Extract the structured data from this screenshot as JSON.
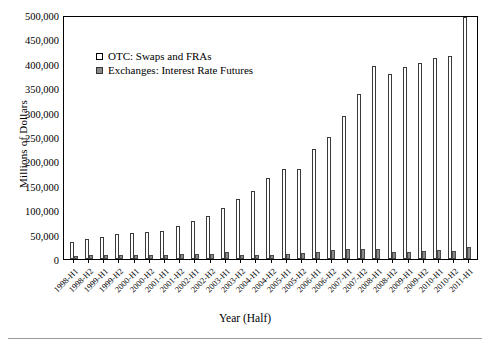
{
  "chart_data": {
    "type": "bar",
    "title": "",
    "xlabel": "Year (Half)",
    "ylabel": "Millions of Dollars",
    "ylim": [
      0,
      500000
    ],
    "yticks": [
      0,
      50000,
      100000,
      150000,
      200000,
      250000,
      300000,
      350000,
      400000,
      450000,
      500000
    ],
    "ytick_labels": [
      "0",
      "50,000",
      "100,000",
      "150,000",
      "200,000",
      "250,000",
      "300,000",
      "350,000",
      "400,000",
      "450,000",
      "500,000"
    ],
    "grid": false,
    "legend_position": "upper-left-inside",
    "categories": [
      "1998-H1",
      "1998-H2",
      "1999-H1",
      "1999-H2",
      "2000-H1",
      "2000-H2",
      "2001-H1",
      "2001-H2",
      "2002-H1",
      "2002-H2",
      "2003-H1",
      "2003-H2",
      "2004-H1",
      "2004-H2",
      "2005-H1",
      "2005-H2",
      "2006-H1",
      "2006-H2",
      "2007-H1",
      "2007-H2",
      "2008-H1",
      "2008-H2",
      "2009-H1",
      "2009-H2",
      "2010-H1",
      "2010-H2",
      "2011-H1"
    ],
    "series": [
      {
        "name": "OTC: Swaps and FRAs",
        "color": "#ffffff",
        "edge_color": "#3a3a3a",
        "values": [
          34000,
          41000,
          45000,
          51000,
          54000,
          55000,
          58000,
          67000,
          78000,
          88000,
          105000,
          123000,
          140000,
          165000,
          184000,
          184000,
          225000,
          250000,
          293000,
          338000,
          396000,
          379000,
          393000,
          402000,
          412000,
          417000,
          495000
        ]
      },
      {
        "name": "Exchanges: Interest Rate Futures",
        "color": "#8a8a8a",
        "edge_color": "#4a4a4a",
        "values": [
          7000,
          8000,
          7500,
          8000,
          8000,
          7500,
          8500,
          10000,
          11000,
          10000,
          14000,
          8000,
          9000,
          9000,
          11000,
          13000,
          14000,
          18000,
          21000,
          20000,
          21000,
          15000,
          15000,
          17000,
          18000,
          17000,
          25000
        ]
      }
    ]
  }
}
